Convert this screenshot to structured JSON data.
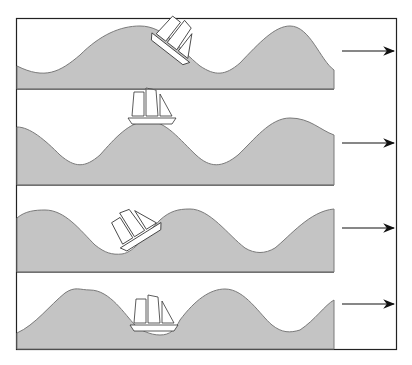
{
  "diagram": {
    "title": "",
    "colors": {
      "water": "#c4c4c4",
      "wave_edge": "#7a7a7a",
      "frame": "#222222",
      "background": "#ffffff"
    },
    "panels": [
      {
        "index": 1,
        "ship_position": "on descending slope after crest",
        "direction_arrow": "right"
      },
      {
        "index": 2,
        "ship_position": "on wave crest",
        "direction_arrow": "right"
      },
      {
        "index": 3,
        "ship_position": "on rising slope before crest",
        "direction_arrow": "right"
      },
      {
        "index": 4,
        "ship_position": "in wave trough",
        "direction_arrow": "right"
      }
    ]
  }
}
